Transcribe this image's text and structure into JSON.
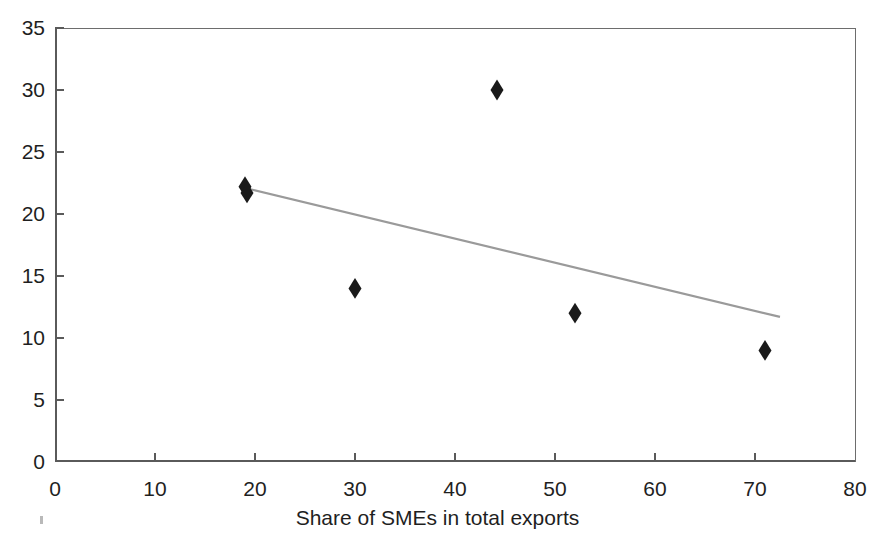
{
  "figure": {
    "clipped_top_text": "",
    "background_color": "#ffffff"
  },
  "axis_labels": {
    "y": [
      "0",
      "5",
      "10",
      "15",
      "20",
      "25",
      "30",
      "35"
    ],
    "x": [
      "0",
      "10",
      "20",
      "30",
      "40",
      "50",
      "60",
      "70",
      "80"
    ],
    "x_title": "Share of SMEs in total exports",
    "y_title": ""
  },
  "chart_data": {
    "type": "scatter",
    "title": "",
    "xlabel": "Share of SMEs in total exports",
    "ylabel": "",
    "xlim": [
      0,
      80
    ],
    "ylim": [
      0,
      35
    ],
    "xticks": [
      0,
      10,
      20,
      30,
      40,
      50,
      60,
      70,
      80
    ],
    "yticks": [
      0,
      5,
      10,
      15,
      20,
      25,
      30,
      35
    ],
    "grid": false,
    "legend": false,
    "marker": {
      "shape": "diamond",
      "color": "#1a1a1a",
      "size": 13
    },
    "points": [
      {
        "x": 19.0,
        "y": 22.2
      },
      {
        "x": 19.2,
        "y": 21.7
      },
      {
        "x": 30.0,
        "y": 14.0
      },
      {
        "x": 44.2,
        "y": 30.0
      },
      {
        "x": 52.0,
        "y": 12.0
      },
      {
        "x": 71.0,
        "y": 9.0
      }
    ],
    "series": [
      {
        "name": "observations",
        "x": [
          19.0,
          19.2,
          30.0,
          44.2,
          52.0,
          71.0
        ],
        "values": [
          22.2,
          21.7,
          14.0,
          30.0,
          12.0,
          9.0
        ]
      }
    ],
    "trendline": {
      "type": "linear",
      "color": "#9a9a9a",
      "width": 2.2,
      "x_start": 19.0,
      "y_start": 22.1,
      "x_end": 72.5,
      "y_end": 11.7
    }
  }
}
